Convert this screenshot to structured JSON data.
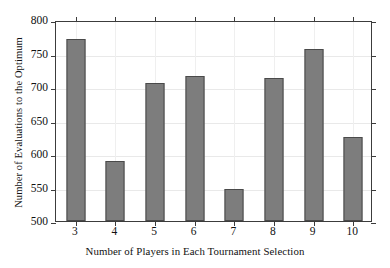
{
  "chart_data": {
    "type": "bar",
    "title": "",
    "xlabel": "Number of Players in Each Tournament Selection",
    "ylabel": "Number of Evaluations to the Optimum",
    "categories": [
      "3",
      "4",
      "5",
      "6",
      "7",
      "8",
      "9",
      "10"
    ],
    "values": [
      771,
      590,
      706,
      717,
      548,
      714,
      757,
      625
    ],
    "ylim": [
      500,
      800
    ],
    "ytick_labels": [
      "500",
      "550",
      "600",
      "650",
      "700",
      "750",
      "800"
    ],
    "ytick_values": [
      500,
      550,
      600,
      650,
      700,
      750,
      800
    ],
    "xtick_labels": [
      "3",
      "4",
      "5",
      "6",
      "7",
      "8",
      "9",
      "10"
    ],
    "grid": true,
    "legend": false,
    "bar_color": "#7d7d7d",
    "bar_edge_color": "#4a4a4a",
    "axis_color": "#3c3c3c",
    "grid_color": "#e9e9e9",
    "background": "#ffffff"
  }
}
